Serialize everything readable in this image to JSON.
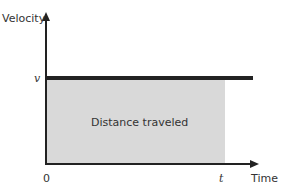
{
  "diagram": {
    "y_axis_label": "Velocity",
    "x_axis_label": "Time",
    "y_tick": "v",
    "x_origin": "0",
    "x_tick": "t",
    "area_label": "Distance traveled",
    "colors": {
      "area": "#d9d9d9",
      "line": "#222222",
      "axis": "#222222"
    }
  }
}
